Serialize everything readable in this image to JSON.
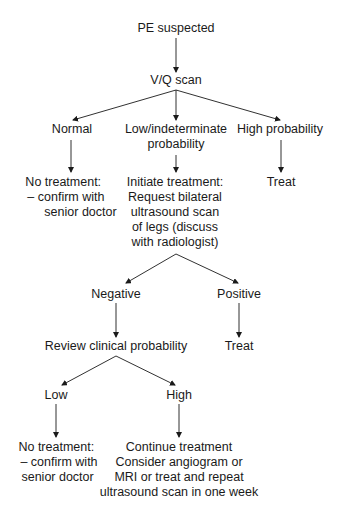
{
  "diagram": {
    "type": "flowchart",
    "nodes": {
      "pe_suspected": {
        "lines": [
          "PE suspected"
        ]
      },
      "vq_scan": {
        "lines": [
          "V/Q scan"
        ]
      },
      "normal": {
        "lines": [
          "Normal"
        ]
      },
      "low_indeterminate": {
        "lines": [
          "Low/indeterminate",
          "probability"
        ]
      },
      "high_probability": {
        "lines": [
          "High probability"
        ]
      },
      "no_treatment_1": {
        "lines": [
          "No treatment:",
          "–  confirm with",
          "senior doctor"
        ]
      },
      "initiate_treatment": {
        "lines": [
          "Initiate treatment:",
          "Request bilateral",
          "ultrasound scan",
          "of legs (discuss",
          "with radiologist)"
        ]
      },
      "treat_1": {
        "lines": [
          "Treat"
        ]
      },
      "negative": {
        "lines": [
          "Negative"
        ]
      },
      "positive": {
        "lines": [
          "Positive"
        ]
      },
      "review_clinical": {
        "lines": [
          "Review clinical probability"
        ]
      },
      "treat_2": {
        "lines": [
          "Treat"
        ]
      },
      "low": {
        "lines": [
          "Low"
        ]
      },
      "high": {
        "lines": [
          "High"
        ]
      },
      "no_treatment_2": {
        "lines": [
          "No treatment:",
          "–  confirm with",
          "senior doctor"
        ]
      },
      "continue_treatment": {
        "lines": [
          "Continue treatment",
          "Consider angiogram or",
          "MRI or treat and repeat",
          "ultrasound scan in one week"
        ]
      }
    },
    "edges": [
      [
        "pe_suspected",
        "vq_scan"
      ],
      [
        "vq_scan",
        "normal"
      ],
      [
        "vq_scan",
        "low_indeterminate"
      ],
      [
        "vq_scan",
        "high_probability"
      ],
      [
        "normal",
        "no_treatment_1"
      ],
      [
        "low_indeterminate",
        "initiate_treatment"
      ],
      [
        "high_probability",
        "treat_1"
      ],
      [
        "initiate_treatment",
        "negative"
      ],
      [
        "initiate_treatment",
        "positive"
      ],
      [
        "negative",
        "review_clinical"
      ],
      [
        "positive",
        "treat_2"
      ],
      [
        "review_clinical",
        "low"
      ],
      [
        "review_clinical",
        "high"
      ],
      [
        "low",
        "no_treatment_2"
      ],
      [
        "high",
        "continue_treatment"
      ]
    ],
    "colors": {
      "line": "#1a1a1a",
      "text": "#1a1a1a",
      "background": "#ffffff"
    }
  }
}
